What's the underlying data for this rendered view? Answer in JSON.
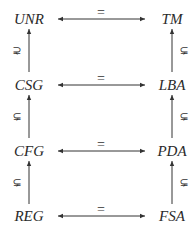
{
  "diagram": {
    "rows": [
      {
        "left": "UNR",
        "right": "TM",
        "relation": "="
      },
      {
        "left": "CSG",
        "right": "LBA",
        "relation": "="
      },
      {
        "left": "CFG",
        "right": "PDA",
        "relation": "="
      },
      {
        "left": "REG",
        "right": "FSA",
        "relation": "="
      }
    ],
    "vertical_relation": "⊊",
    "colors": {
      "text": "#2a2a2a",
      "line": "#333333",
      "background": "#ffffff"
    }
  }
}
